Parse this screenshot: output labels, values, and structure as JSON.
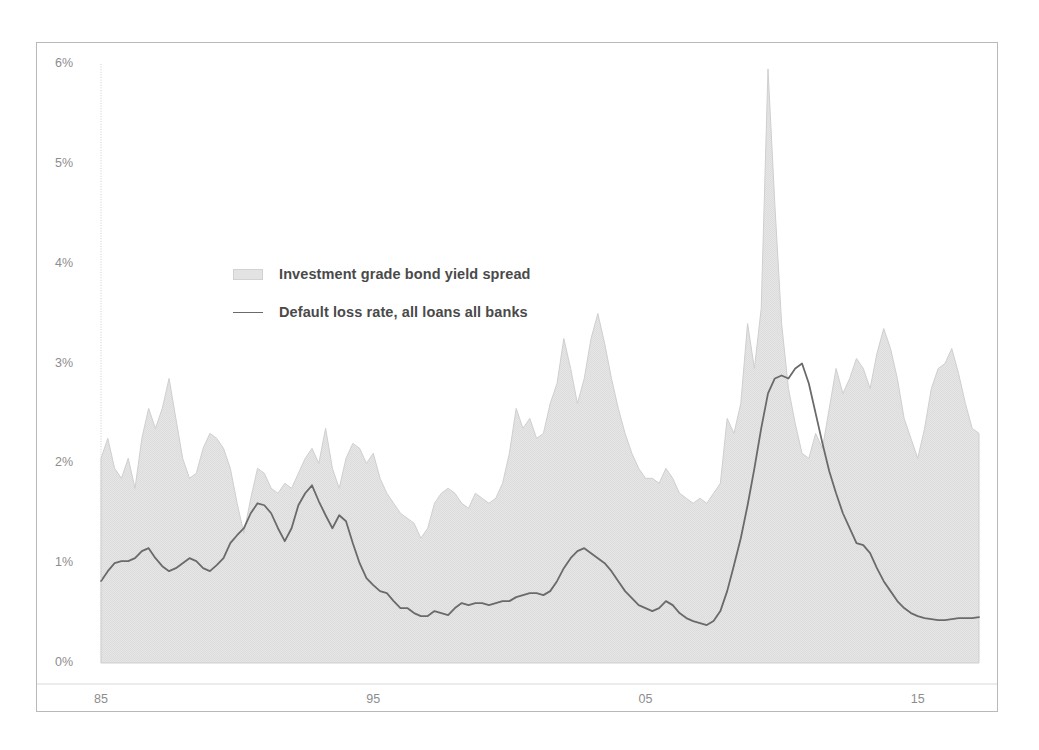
{
  "chart_data": {
    "type": "area",
    "title": "",
    "subtitle": "",
    "xlabel": "",
    "ylabel": "",
    "xlim": [
      1985,
      2017.25
    ],
    "ylim": [
      0,
      6
    ],
    "grid": false,
    "legend_position": "inside-upper-left",
    "y_tick_labels": [
      "0%",
      "1%",
      "2%",
      "3%",
      "4%",
      "5%",
      "6%"
    ],
    "y_tick_values": [
      0,
      1,
      2,
      3,
      4,
      5,
      6
    ],
    "x_tick_labels": [
      "85",
      "95",
      "05",
      "15"
    ],
    "x_tick_values": [
      1985,
      1995,
      2005,
      2015
    ],
    "colors": {
      "area_fill": "#e3e3e3",
      "area_edge": "#cfcfcf",
      "line": "#6a6a6a",
      "axis_text": "#8d8d8d",
      "legend_text": "#4a4a4a",
      "frame": "#b9b9b9",
      "background": "#ffffff"
    },
    "series": [
      {
        "name": "Investment grade bond yield spread",
        "render": "area",
        "x": [
          1985.0,
          1985.25,
          1985.5,
          1985.75,
          1986.0,
          1986.25,
          1986.5,
          1986.75,
          1987.0,
          1987.25,
          1987.5,
          1987.75,
          1988.0,
          1988.25,
          1988.5,
          1988.75,
          1989.0,
          1989.25,
          1989.5,
          1989.75,
          1990.0,
          1990.25,
          1990.5,
          1990.75,
          1991.0,
          1991.25,
          1991.5,
          1991.75,
          1992.0,
          1992.25,
          1992.5,
          1992.75,
          1993.0,
          1993.25,
          1993.5,
          1993.75,
          1994.0,
          1994.25,
          1994.5,
          1994.75,
          1995.0,
          1995.25,
          1995.5,
          1995.75,
          1996.0,
          1996.25,
          1996.5,
          1996.75,
          1997.0,
          1997.25,
          1997.5,
          1997.75,
          1998.0,
          1998.25,
          1998.5,
          1998.75,
          1999.0,
          1999.25,
          1999.5,
          1999.75,
          2000.0,
          2000.25,
          2000.5,
          2000.75,
          2001.0,
          2001.25,
          2001.5,
          2001.75,
          2002.0,
          2002.25,
          2002.5,
          2002.75,
          2003.0,
          2003.25,
          2003.5,
          2003.75,
          2004.0,
          2004.25,
          2004.5,
          2004.75,
          2005.0,
          2005.25,
          2005.5,
          2005.75,
          2006.0,
          2006.25,
          2006.5,
          2006.75,
          2007.0,
          2007.25,
          2007.5,
          2007.75,
          2008.0,
          2008.25,
          2008.5,
          2008.75,
          2009.0,
          2009.25,
          2009.5,
          2009.75,
          2010.0,
          2010.25,
          2010.5,
          2010.75,
          2011.0,
          2011.25,
          2011.5,
          2011.75,
          2012.0,
          2012.25,
          2012.5,
          2012.75,
          2013.0,
          2013.25,
          2013.5,
          2013.75,
          2014.0,
          2014.25,
          2014.5,
          2014.75,
          2015.0,
          2015.25,
          2015.5,
          2015.75,
          2016.0,
          2016.25,
          2016.5,
          2016.75,
          2017.0,
          2017.25
        ],
        "values": [
          2.05,
          2.25,
          1.95,
          1.85,
          2.05,
          1.75,
          2.25,
          2.55,
          2.35,
          2.55,
          2.85,
          2.45,
          2.05,
          1.85,
          1.9,
          2.15,
          2.3,
          2.25,
          2.15,
          1.95,
          1.6,
          1.3,
          1.65,
          1.95,
          1.9,
          1.75,
          1.7,
          1.8,
          1.75,
          1.9,
          2.05,
          2.15,
          2.0,
          2.35,
          1.95,
          1.75,
          2.05,
          2.2,
          2.15,
          2.0,
          2.1,
          1.85,
          1.7,
          1.6,
          1.5,
          1.45,
          1.4,
          1.25,
          1.35,
          1.6,
          1.7,
          1.75,
          1.7,
          1.6,
          1.55,
          1.7,
          1.65,
          1.6,
          1.65,
          1.8,
          2.1,
          2.55,
          2.35,
          2.45,
          2.25,
          2.3,
          2.6,
          2.8,
          3.25,
          2.95,
          2.6,
          2.85,
          3.25,
          3.5,
          3.2,
          2.85,
          2.55,
          2.3,
          2.1,
          1.95,
          1.85,
          1.85,
          1.8,
          1.95,
          1.85,
          1.7,
          1.65,
          1.6,
          1.65,
          1.6,
          1.7,
          1.8,
          2.45,
          2.3,
          2.6,
          3.4,
          2.95,
          3.55,
          5.95,
          4.6,
          3.4,
          2.75,
          2.4,
          2.1,
          2.05,
          2.3,
          2.15,
          2.55,
          2.95,
          2.7,
          2.85,
          3.05,
          2.95,
          2.75,
          3.1,
          3.35,
          3.15,
          2.85,
          2.45,
          2.25,
          2.05,
          2.35,
          2.75,
          2.95,
          3.0,
          3.15,
          2.9,
          2.6,
          2.35,
          2.3
        ]
      },
      {
        "name": "Default loss rate, all loans all banks",
        "render": "line",
        "x": [
          1985.0,
          1985.25,
          1985.5,
          1985.75,
          1986.0,
          1986.25,
          1986.5,
          1986.75,
          1987.0,
          1987.25,
          1987.5,
          1987.75,
          1988.0,
          1988.25,
          1988.5,
          1988.75,
          1989.0,
          1989.25,
          1989.5,
          1989.75,
          1990.0,
          1990.25,
          1990.5,
          1990.75,
          1991.0,
          1991.25,
          1991.5,
          1991.75,
          1992.0,
          1992.25,
          1992.5,
          1992.75,
          1993.0,
          1993.25,
          1993.5,
          1993.75,
          1994.0,
          1994.25,
          1994.5,
          1994.75,
          1995.0,
          1995.25,
          1995.5,
          1995.75,
          1996.0,
          1996.25,
          1996.5,
          1996.75,
          1997.0,
          1997.25,
          1997.5,
          1997.75,
          1998.0,
          1998.25,
          1998.5,
          1998.75,
          1999.0,
          1999.25,
          1999.5,
          1999.75,
          2000.0,
          2000.25,
          2000.5,
          2000.75,
          2001.0,
          2001.25,
          2001.5,
          2001.75,
          2002.0,
          2002.25,
          2002.5,
          2002.75,
          2003.0,
          2003.25,
          2003.5,
          2003.75,
          2004.0,
          2004.25,
          2004.5,
          2004.75,
          2005.0,
          2005.25,
          2005.5,
          2005.75,
          2006.0,
          2006.25,
          2006.5,
          2006.75,
          2007.0,
          2007.25,
          2007.5,
          2007.75,
          2008.0,
          2008.25,
          2008.5,
          2008.75,
          2009.0,
          2009.25,
          2009.5,
          2009.75,
          2010.0,
          2010.25,
          2010.5,
          2010.75,
          2011.0,
          2011.25,
          2011.5,
          2011.75,
          2012.0,
          2012.25,
          2012.5,
          2012.75,
          2013.0,
          2013.25,
          2013.5,
          2013.75,
          2014.0,
          2014.25,
          2014.5,
          2014.75,
          2015.0,
          2015.25,
          2015.5,
          2015.75,
          2016.0,
          2016.25,
          2016.5,
          2016.75,
          2017.0,
          2017.25
        ],
        "values": [
          0.82,
          0.92,
          1.0,
          1.02,
          1.02,
          1.05,
          1.12,
          1.15,
          1.05,
          0.97,
          0.92,
          0.95,
          1.0,
          1.05,
          1.02,
          0.95,
          0.92,
          0.98,
          1.05,
          1.2,
          1.28,
          1.35,
          1.5,
          1.6,
          1.58,
          1.5,
          1.35,
          1.22,
          1.35,
          1.58,
          1.7,
          1.78,
          1.62,
          1.48,
          1.35,
          1.48,
          1.42,
          1.2,
          1.0,
          0.85,
          0.78,
          0.72,
          0.7,
          0.62,
          0.55,
          0.55,
          0.5,
          0.47,
          0.47,
          0.52,
          0.5,
          0.48,
          0.55,
          0.6,
          0.58,
          0.6,
          0.6,
          0.58,
          0.6,
          0.62,
          0.62,
          0.66,
          0.68,
          0.7,
          0.7,
          0.68,
          0.72,
          0.82,
          0.95,
          1.05,
          1.12,
          1.15,
          1.1,
          1.05,
          1.0,
          0.92,
          0.82,
          0.72,
          0.65,
          0.58,
          0.55,
          0.52,
          0.55,
          0.62,
          0.58,
          0.5,
          0.45,
          0.42,
          0.4,
          0.38,
          0.42,
          0.52,
          0.72,
          0.98,
          1.25,
          1.58,
          1.95,
          2.35,
          2.7,
          2.85,
          2.88,
          2.85,
          2.95,
          3.0,
          2.8,
          2.5,
          2.2,
          1.92,
          1.7,
          1.5,
          1.35,
          1.2,
          1.18,
          1.1,
          0.95,
          0.82,
          0.72,
          0.62,
          0.55,
          0.5,
          0.47,
          0.45,
          0.44,
          0.43,
          0.43,
          0.44,
          0.45,
          0.45,
          0.45,
          0.46
        ]
      }
    ]
  },
  "legend": {
    "items": [
      {
        "label": "Investment grade bond yield spread",
        "marker": "area-swatch"
      },
      {
        "label": "Default loss rate, all loans all banks",
        "marker": "line-swatch"
      }
    ]
  }
}
